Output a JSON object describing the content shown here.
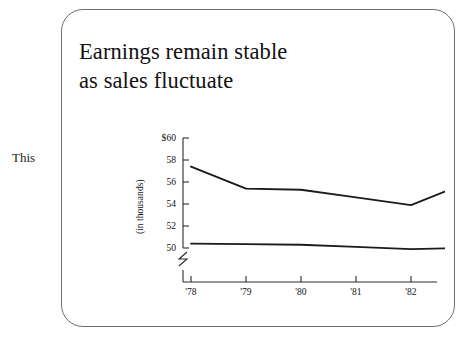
{
  "margin_note": "This",
  "figure": {
    "title_lines": [
      "Earnings remain stable",
      "as sales fluctuate"
    ],
    "card_border_color": "#6e6e6e",
    "background_color": "#ffffff"
  },
  "chart_data": {
    "type": "line",
    "title": "Earnings remain stable as sales fluctuate",
    "xlabel": "",
    "ylabel": "(in thousands)",
    "categories": [
      "'78",
      "'79",
      "'80",
      "'81",
      "'82",
      "'83"
    ],
    "x_tick_labels": [
      "'78",
      "'79",
      "'80",
      "'81",
      "'82",
      "'83"
    ],
    "y_tick_labels": [
      "$60",
      "58",
      "56",
      "54",
      "52",
      "50"
    ],
    "y_tick_values": [
      60,
      58,
      56,
      54,
      52,
      50
    ],
    "ylim": [
      50,
      60
    ],
    "axis_break": true,
    "axis_break_note": "y-axis broken below 50",
    "grid": false,
    "legend_position": "right-inline",
    "series": [
      {
        "name": "Sales",
        "label": "Sales",
        "color": "#1b1b1b",
        "values": [
          57.4,
          55.4,
          55.3,
          54.6,
          53.9,
          55.9
        ]
      },
      {
        "name": "Earnings",
        "label": "Earnings",
        "color": "#1b1b1b",
        "values": [
          50.4,
          50.35,
          50.3,
          50.1,
          49.9,
          50.0
        ]
      }
    ],
    "annotations": [
      {
        "text": "Sales",
        "attached_to": "Sales",
        "at": "'83"
      },
      {
        "text": "Earnings",
        "attached_to": "Earnings",
        "at": "'83"
      }
    ]
  }
}
